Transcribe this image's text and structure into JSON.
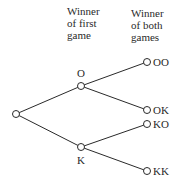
{
  "diagram": {
    "type": "tree",
    "headers": {
      "first": [
        "Winner",
        "of first",
        "game"
      ],
      "both": [
        "Winner",
        "of both",
        "games"
      ]
    },
    "nodes": [
      {
        "id": "root",
        "label": "",
        "x": 16,
        "y": 114
      },
      {
        "id": "O",
        "label": "O",
        "x": 81,
        "y": 86
      },
      {
        "id": "K",
        "label": "K",
        "x": 81,
        "y": 147
      },
      {
        "id": "OO",
        "label": "OO",
        "x": 147,
        "y": 62
      },
      {
        "id": "OK",
        "label": "OK",
        "x": 147,
        "y": 110
      },
      {
        "id": "KO",
        "label": "KO",
        "x": 147,
        "y": 124
      },
      {
        "id": "KK",
        "label": "KK",
        "x": 147,
        "y": 171
      }
    ],
    "edges": [
      [
        "root",
        "O"
      ],
      [
        "root",
        "K"
      ],
      [
        "O",
        "OO"
      ],
      [
        "O",
        "OK"
      ],
      [
        "K",
        "KO"
      ],
      [
        "K",
        "KK"
      ]
    ],
    "labels": {
      "O": "O",
      "K": "K",
      "OO": "OO",
      "OK": "OK",
      "KO": "KO",
      "KK": "KK"
    }
  }
}
